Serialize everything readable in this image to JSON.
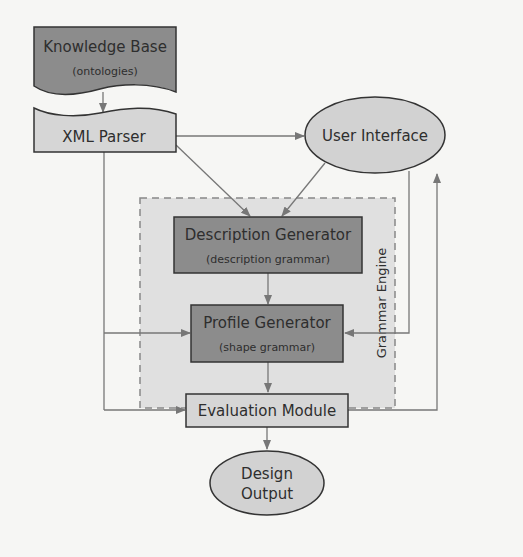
{
  "nodes": {
    "knowledge_base": {
      "title": "Knowledge Base",
      "subtitle": "(ontologies)"
    },
    "xml_parser": {
      "title": "XML Parser"
    },
    "user_interface": {
      "title": "User Interface"
    },
    "grammar_engine": {
      "title": "Grammar Engine"
    },
    "description_generator": {
      "title": "Description Generator",
      "subtitle": "(description grammar)"
    },
    "profile_generator": {
      "title": "Profile Generator",
      "subtitle": "(shape grammar)"
    },
    "evaluation_module": {
      "title": "Evaluation Module"
    },
    "design_output": {
      "line1": "Design",
      "line2": "Output"
    }
  },
  "edges": [
    {
      "from": "Knowledge Base",
      "to": "XML Parser"
    },
    {
      "from": "XML Parser",
      "to": "User Interface"
    },
    {
      "from": "XML Parser",
      "to": "Description Generator"
    },
    {
      "from": "XML Parser",
      "to": "Profile Generator"
    },
    {
      "from": "XML Parser",
      "to": "Evaluation Module"
    },
    {
      "from": "User Interface",
      "to": "Description Generator"
    },
    {
      "from": "User Interface",
      "to": "Profile Generator"
    },
    {
      "from": "Description Generator",
      "to": "Profile Generator"
    },
    {
      "from": "Profile Generator",
      "to": "Evaluation Module"
    },
    {
      "from": "Evaluation Module",
      "to": "User Interface"
    },
    {
      "from": "Evaluation Module",
      "to": "Design Output"
    }
  ],
  "colors": {
    "dark_box": "#8c8c8c",
    "light_box": "#d6d6d6",
    "ellipse": "#d2d2d2",
    "grammar_engine_bg": "#e0e0e0",
    "line": "#777777"
  }
}
